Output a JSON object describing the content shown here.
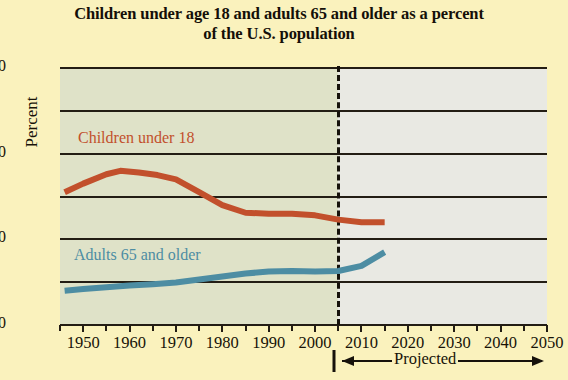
{
  "title": {
    "line1": "Children under age 18 and adults 65 and older as a percent",
    "line2": "of the U.S. population"
  },
  "annotations": {
    "projected_label": "Projected",
    "divider_year": 2005
  },
  "colors": {
    "page_background": "#faf2bd",
    "plot_historical": "#dfe2c8",
    "plot_projected": "#e9e9e3",
    "children_series": "#c2502c",
    "adults_series": "#4d8da3",
    "axis": "#231d14",
    "text": "#171208"
  },
  "chart_data": {
    "type": "line",
    "title": "Children under age 18 and adults 65 and older as a percent of the U.S. population",
    "xlabel": "",
    "ylabel": "Percent",
    "xlim": [
      1945,
      2050
    ],
    "ylim": [
      0,
      60
    ],
    "yticks": [
      0,
      20,
      40,
      60
    ],
    "ytick_labels": [
      "0",
      "20",
      "40",
      "60"
    ],
    "y_minor_gridlines": [
      10,
      30,
      50
    ],
    "xticks": [
      1950,
      1960,
      1970,
      1980,
      1990,
      2000,
      2010,
      2020,
      2030,
      2040,
      2050
    ],
    "xtick_labels": [
      "1950",
      "1960",
      "1970",
      "1980",
      "1990",
      "2000",
      "2010",
      "2020",
      "2030",
      "2040",
      "2050"
    ],
    "x_minor_ticks": [
      1945,
      1955,
      1965,
      1975,
      1985,
      1995,
      2005,
      2015,
      2025,
      2035,
      2045
    ],
    "grid": true,
    "legend": "inline-labels",
    "series": [
      {
        "name": "Children under 18",
        "color": "#c2502c",
        "x": [
          1946,
          1950,
          1955,
          1958,
          1962,
          1966,
          1970,
          1975,
          1980,
          1985,
          1990,
          1995,
          2000,
          2005,
          2010,
          2015
        ],
        "values": [
          31.0,
          33.0,
          35.2,
          36.0,
          35.6,
          35.0,
          34.0,
          31.0,
          28.0,
          26.2,
          26.0,
          26.0,
          25.6,
          24.6,
          24.0,
          24.0
        ]
      },
      {
        "name": "Adults 65 and older",
        "color": "#4d8da3",
        "x": [
          1946,
          1950,
          1955,
          1960,
          1965,
          1970,
          1975,
          1980,
          1985,
          1990,
          1995,
          2000,
          2005,
          2010,
          2015
        ],
        "values": [
          8.0,
          8.4,
          8.8,
          9.2,
          9.5,
          9.9,
          10.6,
          11.3,
          12.0,
          12.5,
          12.6,
          12.5,
          12.6,
          13.8,
          17.0
        ]
      }
    ]
  }
}
